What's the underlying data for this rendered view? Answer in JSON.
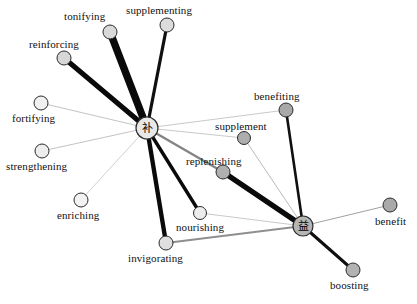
{
  "graph": {
    "title": "",
    "type": "force-directed-network",
    "canvas": {
      "width": 417,
      "height": 304,
      "background": "#ffffff"
    },
    "hubs": [
      {
        "id": "bu",
        "glyph": "补",
        "label": "补",
        "x": 147,
        "y": 128,
        "r": 11,
        "fill": "#e8e8e8",
        "stroke": "#2b2b2b"
      },
      {
        "id": "yi",
        "glyph": "益",
        "label": "益",
        "x": 303,
        "y": 226,
        "r": 10,
        "fill": "#b5b5b5",
        "stroke": "#2b2b2b"
      }
    ],
    "nodes": [
      {
        "id": "tonifying",
        "label": "tonifying",
        "x": 110,
        "y": 32,
        "r": 7,
        "fill": "#d9d9d9",
        "label_x": 64,
        "label_y": 11,
        "align": "left"
      },
      {
        "id": "supplementing",
        "label": "supplementing",
        "x": 167,
        "y": 25,
        "r": 7,
        "fill": "#dcdcdc",
        "label_x": 126,
        "label_y": 5,
        "align": "left"
      },
      {
        "id": "reinforcing",
        "label": "reinforcing",
        "x": 64,
        "y": 58,
        "r": 7,
        "fill": "#d7d7d7",
        "label_x": 29,
        "label_y": 39,
        "align": "left"
      },
      {
        "id": "fortifying",
        "label": "fortifying",
        "x": 41,
        "y": 103,
        "r": 7,
        "fill": "#f0f0f0",
        "label_x": 12,
        "label_y": 113,
        "align": "left"
      },
      {
        "id": "strengthening",
        "label": "strengthening",
        "x": 42,
        "y": 151,
        "r": 7,
        "fill": "#ededed",
        "label_x": 6,
        "label_y": 161,
        "align": "left"
      },
      {
        "id": "enriching",
        "label": "enriching",
        "x": 81,
        "y": 200,
        "r": 7,
        "fill": "#f2f2f2",
        "label_x": 57,
        "label_y": 210,
        "align": "left"
      },
      {
        "id": "invigorating",
        "label": "invigorating",
        "x": 166,
        "y": 243,
        "r": 7,
        "fill": "#dfdfdf",
        "label_x": 128,
        "label_y": 253,
        "align": "left"
      },
      {
        "id": "nourishing",
        "label": "nourishing",
        "x": 200,
        "y": 213,
        "r": 6.5,
        "fill": "#ececec",
        "label_x": 176,
        "label_y": 222,
        "align": "left"
      },
      {
        "id": "replenishing",
        "label": "replenishing",
        "x": 223,
        "y": 172,
        "r": 7,
        "fill": "#b0b0b0",
        "label_x": 186,
        "label_y": 156,
        "align": "left"
      },
      {
        "id": "supplement",
        "label": "supplement",
        "x": 244,
        "y": 138,
        "r": 6.5,
        "fill": "#adadad",
        "label_x": 215,
        "label_y": 121,
        "align": "left"
      },
      {
        "id": "benefiting",
        "label": "benefiting",
        "x": 286,
        "y": 110,
        "r": 7,
        "fill": "#a8a8a8",
        "label_x": 254,
        "label_y": 91,
        "align": "left"
      },
      {
        "id": "benefit",
        "label": "benefit",
        "x": 390,
        "y": 205,
        "r": 7,
        "fill": "#a9a9a9",
        "label_x": 375,
        "label_y": 216,
        "align": "left"
      },
      {
        "id": "boosting",
        "label": "boosting",
        "x": 353,
        "y": 270,
        "r": 7,
        "fill": "#b2b2b2",
        "label_x": 330,
        "label_y": 280,
        "align": "left"
      }
    ],
    "edges": [
      {
        "source": "bu",
        "target": "tonifying",
        "weight": 7.5,
        "color": "#0a0a0a"
      },
      {
        "source": "bu",
        "target": "supplementing",
        "weight": 3.2,
        "color": "#101010"
      },
      {
        "source": "bu",
        "target": "reinforcing",
        "weight": 5.0,
        "color": "#0a0a0a"
      },
      {
        "source": "bu",
        "target": "fortifying",
        "weight": 0.6,
        "color": "#9a9a9a"
      },
      {
        "source": "bu",
        "target": "strengthening",
        "weight": 0.6,
        "color": "#9a9a9a"
      },
      {
        "source": "bu",
        "target": "enriching",
        "weight": 0.6,
        "color": "#b0b0b0"
      },
      {
        "source": "bu",
        "target": "invigorating",
        "weight": 4.4,
        "color": "#0a0a0a"
      },
      {
        "source": "bu",
        "target": "nourishing",
        "weight": 3.4,
        "color": "#0a0a0a"
      },
      {
        "source": "bu",
        "target": "replenishing",
        "weight": 2.4,
        "color": "#848484"
      },
      {
        "source": "bu",
        "target": "supplement",
        "weight": 0.6,
        "color": "#a5a5a5"
      },
      {
        "source": "bu",
        "target": "benefiting",
        "weight": 0.6,
        "color": "#a5a5a5"
      },
      {
        "source": "yi",
        "target": "replenishing",
        "weight": 5.2,
        "color": "#0a0a0a"
      },
      {
        "source": "yi",
        "target": "benefiting",
        "weight": 2.6,
        "color": "#101010"
      },
      {
        "source": "yi",
        "target": "supplement",
        "weight": 0.6,
        "color": "#8a8a8a"
      },
      {
        "source": "yi",
        "target": "nourishing",
        "weight": 0.6,
        "color": "#a5a5a5"
      },
      {
        "source": "yi",
        "target": "invigorating",
        "weight": 1.8,
        "color": "#8f8f8f"
      },
      {
        "source": "yi",
        "target": "benefit",
        "weight": 0.7,
        "color": "#777777"
      },
      {
        "source": "yi",
        "target": "boosting",
        "weight": 3.0,
        "color": "#0f0f0f"
      }
    ]
  }
}
